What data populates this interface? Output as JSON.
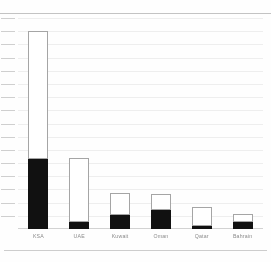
{
  "chart_data": {
    "type": "bar",
    "title": "",
    "subtitle": "",
    "xlabel": "",
    "ylabel": "",
    "stacked": true,
    "grid": true,
    "legend": "none",
    "ylim": [
      0,
      100
    ],
    "gridline_count": 16,
    "tick_count": 16,
    "categories": [
      "KSA",
      "UAE",
      "Kuwait",
      "Oman",
      "Qatar",
      "Bahrain"
    ],
    "series": [
      {
        "name": "lower-segment",
        "color": "#111111",
        "values": [
          33,
          3.5,
          6.5,
          9,
          1.5,
          3.5
        ]
      },
      {
        "name": "upper-segment",
        "color": "#ffffff",
        "values": [
          61,
          30,
          10.5,
          7.5,
          9,
          3.5
        ]
      }
    ],
    "totals": [
      94,
      33.5,
      17,
      16.5,
      10.5,
      7
    ],
    "axis_tick_labels": [],
    "annotations": []
  },
  "colors": {
    "background": "#fefefe",
    "bar_fill_dark": "#111111",
    "bar_fill_light": "#ffffff",
    "bar_outline": "#9a9a9a",
    "gridline": "#eeeeee",
    "tick": "#cfcfcf",
    "axis": "#d2d2d2",
    "rule": "#b8b8b8",
    "label_text": "#8a8a8a"
  }
}
